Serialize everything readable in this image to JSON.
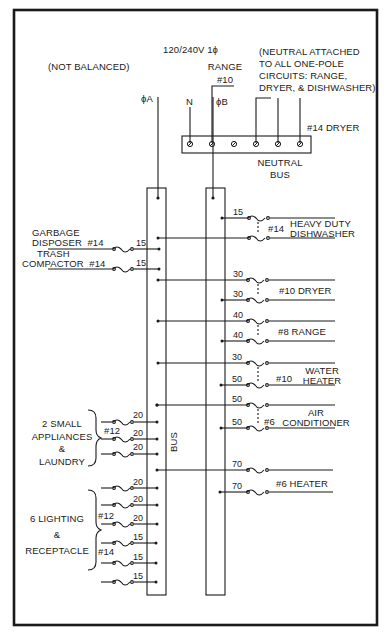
{
  "diagram": {
    "title": "120/240V 1ϕ",
    "note_left": "(NOT BALANCED)",
    "note_right_lines": [
      "(NEUTRAL ATTACHED",
      "TO ALL ONE-POLE",
      "CIRCUITS: RANGE,",
      "DRYER, & DISHWASHER)"
    ],
    "feeds": {
      "phase_a": "ϕA",
      "neutral": "N",
      "phase_b": "ϕB"
    },
    "range_label": [
      "RANGE",
      "#10"
    ],
    "dryer_neutral_label": "#14 DRYER",
    "neutral_bus_label": [
      "NEUTRAL",
      "BUS"
    ],
    "bus_label": "BUS",
    "left_circuits": [
      {
        "name_lines": [
          "GARBAGE",
          "DISPOSER"
        ],
        "wire": "#14",
        "amps": "15"
      },
      {
        "name_lines": [
          "TRASH",
          "COMPACTOR"
        ],
        "wire": "#14",
        "amps": "15"
      }
    ],
    "small_appliances": {
      "label_lines": [
        "2 SMALL",
        "APPLIANCES",
        "&",
        "LAUNDRY"
      ],
      "wire": "#12",
      "amps": [
        "20",
        "20",
        "20"
      ]
    },
    "lighting": {
      "label_lines": [
        "6 LIGHTING",
        "&",
        "RECEPTACLE"
      ],
      "wire_upper": "#12",
      "wire_lower": "#14",
      "amps": [
        "20",
        "20",
        "20",
        "15",
        "15",
        "15"
      ]
    },
    "right_circuits": [
      {
        "load_lines": [
          "HEAVY DUTY",
          "DISHWASHER"
        ],
        "wire": "#14",
        "amps": [
          "15",
          ""
        ]
      },
      {
        "load_lines": [
          "DRYER"
        ],
        "wire": "#10",
        "amps": [
          "30",
          "30"
        ]
      },
      {
        "load_lines": [
          "RANGE"
        ],
        "wire": "#8",
        "amps": [
          "40",
          "40"
        ]
      },
      {
        "load_lines": [
          "WATER",
          "HEATER"
        ],
        "wire": "#10",
        "amps": [
          "30",
          "50"
        ]
      },
      {
        "load_lines": [
          "AIR",
          "CONDITIONER"
        ],
        "wire": "#6",
        "amps": [
          "50",
          "50"
        ]
      },
      {
        "load_lines": [
          "HEATER"
        ],
        "wire": "#6",
        "amps": [
          "70",
          "70"
        ]
      }
    ],
    "colors": {
      "ink": "#1a1a1a",
      "paper": "#ffffff"
    }
  }
}
